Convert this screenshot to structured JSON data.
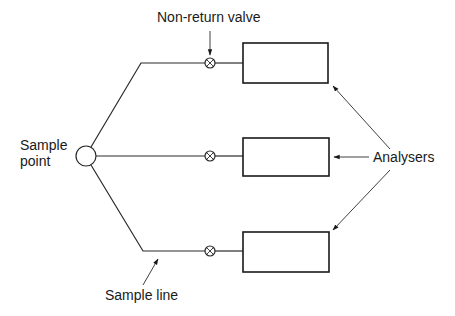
{
  "diagram": {
    "labels": {
      "non_return_valve": "Non-return valve",
      "sample_point_line1": "Sample",
      "sample_point_line2": "point",
      "analysers": "Analysers",
      "sample_line": "Sample line"
    },
    "sample_point": {
      "cx": 86,
      "cy": 156,
      "r": 10
    },
    "branches": [
      {
        "name": "top",
        "y": 63,
        "corner_x": 141,
        "valve_x": 210
      },
      {
        "name": "middle",
        "y": 156,
        "corner_x": 96,
        "valve_x": 210
      },
      {
        "name": "bottom",
        "y": 251,
        "corner_x": 143,
        "valve_x": 210
      }
    ],
    "analysers": [
      {
        "name": "analyser-top",
        "x": 243,
        "y": 43,
        "w": 85,
        "h": 40
      },
      {
        "name": "analyser-middle",
        "x": 243,
        "y": 138,
        "w": 86,
        "h": 38
      },
      {
        "name": "analyser-bottom",
        "x": 243,
        "y": 232,
        "w": 86,
        "h": 40
      }
    ],
    "colors": {
      "line": "#2a2a2a",
      "text": "#1a1a1a",
      "background": "#ffffff"
    }
  }
}
